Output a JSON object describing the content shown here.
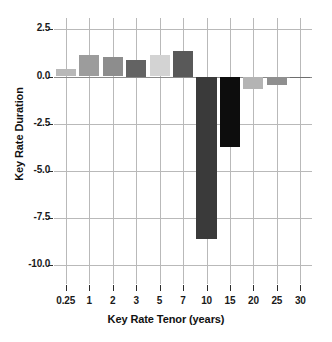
{
  "chart_data": {
    "type": "bar",
    "title": "",
    "xlabel": "Key Rate Tenor (years)",
    "ylabel": "Key Rate Duration",
    "categories": [
      "0.25",
      "1",
      "2",
      "3",
      "5",
      "7",
      "10",
      "15",
      "20",
      "25",
      "30"
    ],
    "values": [
      0.4,
      1.15,
      1.05,
      0.9,
      1.15,
      1.35,
      -8.6,
      -3.75,
      -0.65,
      -0.45,
      -0.05
    ],
    "bar_colors": [
      "#b8b8b8",
      "#9c9c9c",
      "#8d8d8d",
      "#636363",
      "#d3d3d3",
      "#595959",
      "#3a3a3a",
      "#0d0d0d",
      "#b4b4b4",
      "#8f8f8f",
      "#6e6e6e"
    ],
    "ylim": [
      -11.0,
      3.1
    ],
    "yticks": [
      2.5,
      0.0,
      -2.5,
      -5.0,
      -7.5,
      -10.0
    ],
    "ytick_labels": [
      "2.5",
      "0.0",
      "-2.5",
      "-5.0",
      "-7.5",
      "-10.0"
    ],
    "grid": true,
    "grid_color": "#b9b9b9",
    "legend": null,
    "background": "#ffffff"
  }
}
